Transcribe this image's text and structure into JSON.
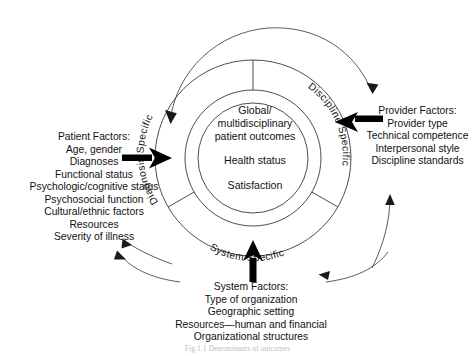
{
  "figure": {
    "caption": "Fig 1.1 Determinants of outcomes"
  },
  "center": {
    "line1": "Global/",
    "line2": "multidisciplinary",
    "line3": "patient outcomes",
    "line4": "Health status",
    "line5": "Satisfaction"
  },
  "ring_labels": {
    "diagnosis": "Diagnosis Specific",
    "discipline": "Discipline Specific",
    "system": "System Specific"
  },
  "patient_factors": {
    "title": "Patient Factors:",
    "items": [
      "Age, gender",
      "Diagnoses",
      "Functional status",
      "Psychologic/cognitive status",
      "Psychosocial function",
      "Cultural/ethnic factors",
      "Resources",
      "Severity of illness"
    ]
  },
  "provider_factors": {
    "title": "Provider Factors:",
    "items": [
      "Provider type",
      "Technical competence",
      "Interpersonal style",
      "Discipline standards"
    ]
  },
  "system_factors": {
    "title": "System Factors:",
    "items": [
      "Type of organization",
      "Geographic setting",
      "Resources—human and financial",
      "Organizational structures"
    ]
  },
  "colors": {
    "stroke": "#3a3a3a",
    "arrow_thin": "#4a4a4a",
    "arrow_bold": "#000000",
    "text": "#111111",
    "background": "#ffffff"
  }
}
